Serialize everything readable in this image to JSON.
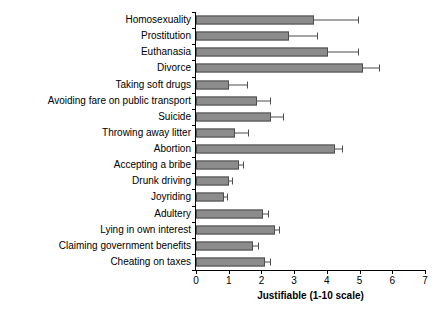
{
  "chart_data": {
    "type": "bar",
    "orientation": "horizontal",
    "title": "",
    "subtitle": "",
    "xlabel": "Justifiable (1-10 scale)",
    "ylabel": "",
    "xlim": [
      0,
      7
    ],
    "xticks": [
      0,
      1,
      2,
      3,
      4,
      5,
      6,
      7
    ],
    "xtick_labels": [
      "0",
      "1",
      "2",
      "3",
      "4",
      "5",
      "6",
      "7"
    ],
    "grid": false,
    "legend": null,
    "error_bars": "horizontal caps at upper bound",
    "bar_color": "#8c8c8c",
    "bar_edge_color": "#4d4d4d",
    "categories": [
      "Homosexuality",
      "Prostitution",
      "Euthanasia",
      "Divorce",
      "Taking soft drugs",
      "Avoiding fare on public transport",
      "Suicide",
      "Throwing away litter",
      "Abortion",
      "Accepting a bribe",
      "Drunk driving",
      "Joyriding",
      "Adultery",
      "Lying in own interest",
      "Claiming government benefits",
      "Cheating on taxes"
    ],
    "values": [
      3.6,
      2.85,
      4.05,
      5.1,
      1.0,
      1.85,
      2.3,
      1.2,
      4.25,
      1.3,
      1.0,
      0.85,
      2.05,
      2.4,
      1.75,
      2.1
    ],
    "error_upper": [
      4.95,
      3.7,
      4.95,
      5.6,
      1.55,
      2.25,
      2.65,
      1.6,
      4.45,
      1.45,
      1.1,
      0.95,
      2.2,
      2.55,
      1.9,
      2.25
    ]
  }
}
